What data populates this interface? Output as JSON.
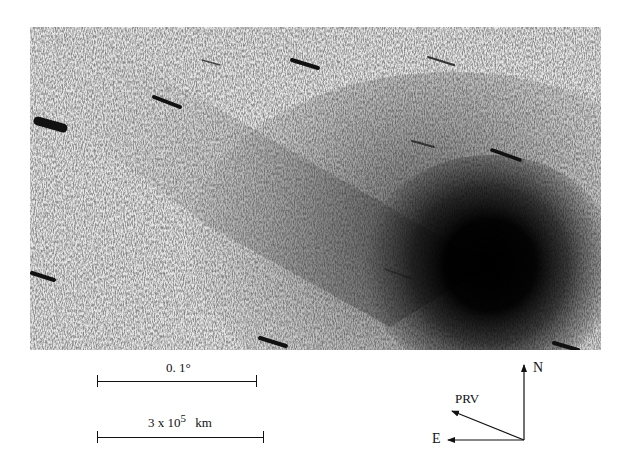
{
  "figure": {
    "colors": {
      "background": "#e4e4e4",
      "nucleus": "#050505",
      "star_trail": "#111111"
    }
  },
  "scale_bars": [
    {
      "label": "0. 1°"
    },
    {
      "label_base": "3 x 10",
      "label_exp": "5",
      "label_unit": "km"
    }
  ],
  "compass": {
    "north_label": "N",
    "east_label": "E",
    "prv_label": "PRV"
  }
}
